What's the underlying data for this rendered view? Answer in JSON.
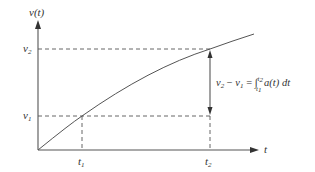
{
  "diagram": {
    "y_axis_label": {
      "base": "v",
      "arg": "(t)"
    },
    "x_axis_label": "t",
    "v2_label": {
      "base": "v",
      "sub": "2"
    },
    "v1_label": {
      "base": "v",
      "sub": "1"
    },
    "t1_label": {
      "base": "t",
      "sub": "1"
    },
    "t2_label": {
      "base": "t",
      "sub": "2"
    },
    "formula": {
      "lhs_v2": "v",
      "lhs_v2_sub": "2",
      "minus": " − ",
      "lhs_v1": "v",
      "lhs_v1_sub": "1",
      "equals": " = ",
      "integral": "∫",
      "upper": "t",
      "upper_sub": "2",
      "lower": "t",
      "lower_sub": "1",
      "integrand": " a(t) dt"
    },
    "colors": {
      "line": "#555555",
      "text": "#333333"
    }
  }
}
